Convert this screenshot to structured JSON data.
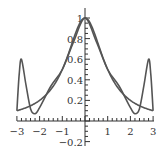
{
  "chart_data": {
    "type": "line",
    "title": "",
    "xlabel": "",
    "ylabel": "",
    "xlim": [
      -3,
      3
    ],
    "ylim": [
      -0.2,
      1.05
    ],
    "grid": false,
    "legend": null,
    "x_ticks": [
      -3,
      -2,
      -1,
      1,
      2,
      3
    ],
    "x_tick_labels": [
      "−3",
      "−2",
      "−1",
      "1",
      "2",
      "3"
    ],
    "y_ticks": [
      -0.2,
      0.2,
      0.4,
      0.6,
      0.8,
      1
    ],
    "y_tick_labels": [
      "−0.2",
      "0.2",
      "0.4",
      "0.6",
      "0.8",
      "1"
    ],
    "series": [
      {
        "name": "f(x) = 1/(1+x^2)",
        "x": [
          -3,
          -2.5,
          -2,
          -1.5,
          -1,
          -0.5,
          0,
          0.5,
          1,
          1.5,
          2,
          2.5,
          3
        ],
        "values": [
          0.1,
          0.14,
          0.2,
          0.31,
          0.5,
          0.8,
          1.0,
          0.8,
          0.5,
          0.31,
          0.2,
          0.14,
          0.1
        ]
      },
      {
        "name": "interpolating polynomial",
        "x": [
          -3,
          -2.9,
          -2.8,
          -2.6,
          -2.4,
          -2.2,
          -2,
          -1.5,
          -1,
          -0.5,
          0,
          0.5,
          1,
          1.5,
          2,
          2.2,
          2.4,
          2.6,
          2.8,
          2.9,
          3
        ],
        "values": [
          0.1,
          0.45,
          0.6,
          0.35,
          0.12,
          0.07,
          0.13,
          0.34,
          0.5,
          0.77,
          1.0,
          0.77,
          0.5,
          0.34,
          0.13,
          0.07,
          0.12,
          0.35,
          0.6,
          0.45,
          0.1
        ]
      }
    ]
  }
}
